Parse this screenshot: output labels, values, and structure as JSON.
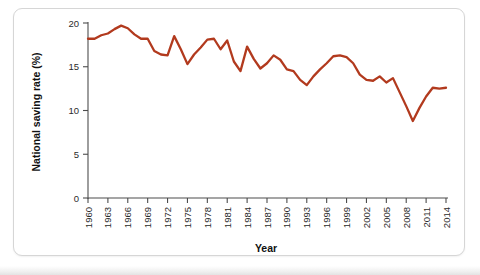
{
  "figure": {
    "background_color": "#ffffff",
    "panel_border_color": "#d6d6d6",
    "axis_color": "#4d4d4d"
  },
  "chart_data": {
    "type": "line",
    "title": "",
    "xlabel": "Year",
    "ylabel": "National saving rate (%)",
    "xlim": [
      1960,
      2014
    ],
    "ylim": [
      0,
      20
    ],
    "yticks": [
      0,
      5,
      10,
      15,
      20
    ],
    "ytick_labels": [
      "0",
      "5",
      "10",
      "15",
      "20"
    ],
    "xticks": [
      1960,
      1963,
      1966,
      1969,
      1972,
      1975,
      1978,
      1981,
      1984,
      1987,
      1990,
      1993,
      1996,
      1999,
      2002,
      2005,
      2008,
      2011,
      2014
    ],
    "xtick_labels": [
      "1960",
      "1963",
      "1966",
      "1969",
      "1972",
      "1975",
      "1978",
      "1981",
      "1984",
      "1987",
      "1990",
      "1993",
      "1996",
      "1999",
      "2002",
      "2005",
      "2008",
      "2011",
      "2014"
    ],
    "grid": false,
    "legend": null,
    "series": [
      {
        "name": "National saving rate",
        "color": "#b23a1e",
        "x": [
          1960,
          1961,
          1962,
          1963,
          1964,
          1965,
          1966,
          1967,
          1968,
          1969,
          1970,
          1971,
          1972,
          1973,
          1974,
          1975,
          1976,
          1977,
          1978,
          1979,
          1980,
          1981,
          1982,
          1983,
          1984,
          1985,
          1986,
          1987,
          1988,
          1989,
          1990,
          1991,
          1992,
          1993,
          1994,
          1995,
          1996,
          1997,
          1998,
          1999,
          2000,
          2001,
          2002,
          2003,
          2004,
          2005,
          2006,
          2007,
          2008,
          2009,
          2010,
          2011,
          2012,
          2013,
          2014
        ],
        "values": [
          18.2,
          18.2,
          18.6,
          18.8,
          19.3,
          19.7,
          19.4,
          18.7,
          18.2,
          18.2,
          16.8,
          16.4,
          16.3,
          18.5,
          17.0,
          15.3,
          16.4,
          17.2,
          18.1,
          18.2,
          17.0,
          18.0,
          15.6,
          14.5,
          17.3,
          15.9,
          14.8,
          15.4,
          16.3,
          15.8,
          14.7,
          14.5,
          13.5,
          12.9,
          13.9,
          14.7,
          15.4,
          16.2,
          16.3,
          16.1,
          15.4,
          14.1,
          13.5,
          13.4,
          13.9,
          13.2,
          13.7,
          12.1,
          10.5,
          8.8,
          10.3,
          11.6,
          12.6,
          12.5,
          12.6
        ]
      }
    ]
  },
  "icons": {
    "axis_tick": "tick-mark"
  }
}
